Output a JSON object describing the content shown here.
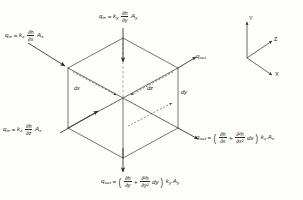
{
  "figure": {
    "type": "isometric-cube-flux-diagram",
    "background_color": "#fdfdfb",
    "line_color": "#3a3a3a"
  },
  "fluxes": {
    "in_x": {
      "name": "q_in_x",
      "symbol": "q",
      "symbol_sub": "in",
      "equals": "=",
      "conductivity": "k",
      "conductivity_sub": "x",
      "grad_num": "∂h",
      "grad_den": "∂x",
      "area": "A",
      "area_sub": "x",
      "plain": "q_in = k_x (∂h/∂x) A_x"
    },
    "in_y": {
      "name": "q_in_y",
      "symbol": "q",
      "symbol_sub": "in",
      "equals": "=",
      "conductivity": "k",
      "conductivity_sub": "y",
      "grad_num": "∂h",
      "grad_den": "∂y",
      "area": "A",
      "area_sub": "y",
      "plain": "q_in = k_y (∂h/∂y) A_y"
    },
    "in_z": {
      "name": "q_in_z",
      "symbol": "q",
      "symbol_sub": "in",
      "equals": "=",
      "conductivity": "k",
      "conductivity_sub": "z",
      "grad_num": "∂h",
      "grad_den": "∂z",
      "area": "A",
      "area_sub": "z",
      "plain": "q_in = k_z (∂h/∂z) A_z"
    },
    "out_x": {
      "name": "q_out_x",
      "symbol": "q",
      "symbol_sub": "out",
      "equals": "=",
      "term1_num": "∂h",
      "term1_den": "∂x",
      "plus": "+",
      "term2_num": "∂²h",
      "term2_den": "∂x²",
      "differential": "dx",
      "conductivity": "k",
      "conductivity_sub": "x",
      "area": "A",
      "area_sub": "x",
      "plain": "q_out = (∂h/∂x + ∂²h/∂x² dx) k_x A_x"
    },
    "out_y": {
      "name": "q_out_y",
      "symbol": "q",
      "symbol_sub": "out",
      "equals": "=",
      "term1_num": "∂h",
      "term1_den": "∂y",
      "plus": "+",
      "term2_num": "∂²h",
      "term2_den": "∂y²",
      "differential": "dy",
      "conductivity": "k",
      "conductivity_sub": "y",
      "area": "A",
      "area_sub": "y",
      "plain": "q_out = (∂h/∂y + ∂²h/∂y² dy) k_y A_y"
    },
    "out_z": {
      "name": "q_out_z",
      "symbol": "q",
      "symbol_sub": "out",
      "plain": "q_out"
    }
  },
  "dimensions": {
    "dx": "dx",
    "dy": "dy",
    "dz": "dz"
  },
  "axes": {
    "x": "X",
    "y": "Y",
    "z": "Z"
  }
}
